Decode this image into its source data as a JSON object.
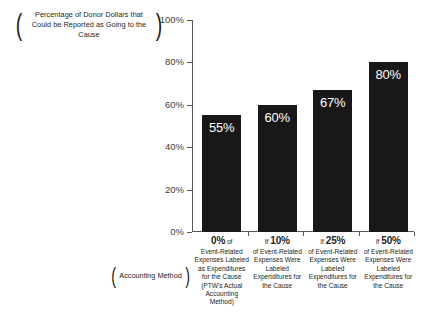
{
  "chart_data": {
    "type": "bar",
    "title": "",
    "ylabel": "Percentage of Donor Dollars that Could be Reported as Going to the Cause",
    "xlabel": "Accounting Method",
    "ylim": [
      0,
      100
    ],
    "yticks": [
      "0%",
      "20%",
      "40%",
      "60%",
      "80%",
      "100%"
    ],
    "ytick_values": [
      0,
      20,
      40,
      60,
      80,
      100
    ],
    "grid": false,
    "legend": "none",
    "bar_color": "#1a1718",
    "axis_color": "#58595b",
    "categories": [
      "0% of Event-Related Expenses Labeled as Expenditures for the Cause (PTW's Actual Accounting Method)",
      "If 10% of Event-Related Expenses Were Labeled Expenditures for the Cause",
      "If 25% of Event-Related Expenses Were Labeled Expenditures for the Cause",
      "If 50% of Event-Related Expenses Were Labeled Expenditures for the Cause"
    ],
    "values": [
      55,
      60,
      67,
      80
    ],
    "value_labels": [
      "55%",
      "60%",
      "67%",
      "80%"
    ],
    "bars": [
      {
        "value": 55,
        "value_label": "55%",
        "head_if": "",
        "head_pct": "0%",
        "head_of": " of",
        "body": "Event-Related Expenses Labeled as Expenditures for the Cause (PTW's Actual Accounting Method)"
      },
      {
        "value": 60,
        "value_label": "60%",
        "head_if": "If ",
        "head_pct": "10%",
        "head_of": "",
        "body": "of Event-Related Expenses Were Labeled Expenditures for the Cause"
      },
      {
        "value": 67,
        "value_label": "67%",
        "head_if": "If ",
        "head_pct": "25%",
        "head_of": "",
        "body": "of Event-Related Expenses Were Labeled Expenditures for the Cause"
      },
      {
        "value": 80,
        "value_label": "80%",
        "head_if": "If ",
        "head_pct": "50%",
        "head_of": "",
        "body": "of Event-Related Expenses Were Labeled Expenditures for the Cause"
      }
    ]
  },
  "axis_titles": {
    "y": "Percentage of Donor Dollars that Could be Reported as Going to the Cause",
    "x": "Accounting Method",
    "paren_open": "(",
    "paren_close": ")"
  }
}
